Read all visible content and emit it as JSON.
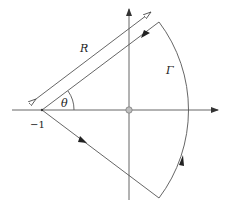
{
  "diagram": {
    "type": "contour-plot",
    "labels": {
      "radius": "R",
      "contour": "Γ",
      "angle": "θ",
      "point": "−1"
    },
    "elements": {
      "real_axis": "horizontal axis with arrow",
      "imaginary_axis": "vertical axis with arrow",
      "origin_marker": "gray circle at origin",
      "sector_contour": "wedge from −1 with rays and circular arc",
      "radius_dimension": "double-headed open-arrow line labelled R"
    },
    "colors": {
      "line": "#555555",
      "origin_fill": "#bdbdbd",
      "background": "#ffffff"
    }
  }
}
